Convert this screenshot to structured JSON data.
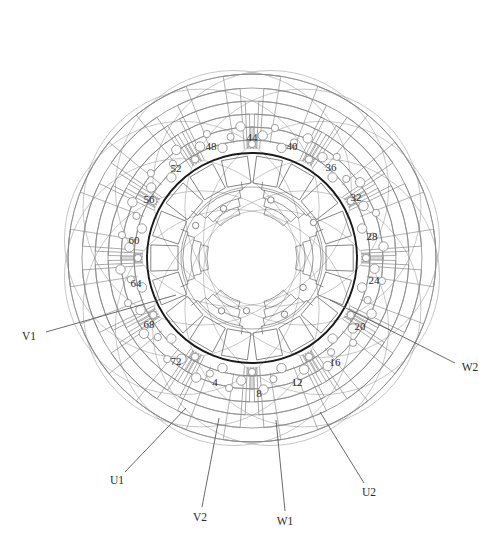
{
  "diagram": {
    "type": "winding-diagram",
    "slot_count": 72,
    "phases": 3,
    "background_color": "#ffffff",
    "bore_circle_color": "#1a1a1a",
    "winding_line_color": "#8a8a8a",
    "coil_line_color": "#6f6f6f",
    "label_color": "#2b2b2b",
    "center": {
      "x": 252,
      "y": 258
    },
    "bore_radius": 105
  },
  "slot_labels": [
    {
      "text": "4",
      "x": 215,
      "y": 382,
      "slot": 4
    },
    {
      "text": "8",
      "x": 259,
      "y": 393,
      "slot": 8
    },
    {
      "text": "12",
      "x": 297,
      "y": 382,
      "slot": 12
    },
    {
      "text": "16",
      "x": 335,
      "y": 362,
      "slot": 16
    },
    {
      "text": "20",
      "x": 360,
      "y": 326,
      "slot": 20
    },
    {
      "text": "24",
      "x": 374,
      "y": 280,
      "slot": 24
    },
    {
      "text": "28",
      "x": 372,
      "y": 236,
      "slot": 28
    },
    {
      "text": "32",
      "x": 356,
      "y": 197,
      "slot": 32
    },
    {
      "text": "36",
      "x": 331,
      "y": 167,
      "slot": 36
    },
    {
      "text": "40",
      "x": 292,
      "y": 146,
      "slot": 40
    },
    {
      "text": "44",
      "x": 252,
      "y": 137,
      "slot": 44
    },
    {
      "text": "48",
      "x": 211,
      "y": 146,
      "slot": 48
    },
    {
      "text": "52",
      "x": 176,
      "y": 168,
      "slot": 52
    },
    {
      "text": "56",
      "x": 149,
      "y": 199,
      "slot": 56
    },
    {
      "text": "60",
      "x": 134,
      "y": 240,
      "slot": 60
    },
    {
      "text": "64",
      "x": 136,
      "y": 283,
      "slot": 64
    },
    {
      "text": "68",
      "x": 149,
      "y": 324,
      "slot": 68
    },
    {
      "text": "72",
      "x": 176,
      "y": 361,
      "slot": 72
    }
  ],
  "terminals": [
    {
      "text": "V1",
      "x": 29,
      "y": 336,
      "lead_from": {
        "x": 46,
        "y": 332
      },
      "lead_to": {
        "x": 176,
        "y": 295
      }
    },
    {
      "text": "W2",
      "x": 470,
      "y": 367,
      "lead_from": {
        "x": 455,
        "y": 363
      },
      "lead_to": {
        "x": 330,
        "y": 300
      }
    },
    {
      "text": "U1",
      "x": 117,
      "y": 480,
      "lead_from": {
        "x": 125,
        "y": 472
      },
      "lead_to": {
        "x": 186,
        "y": 408
      }
    },
    {
      "text": "V2",
      "x": 200,
      "y": 517,
      "lead_from": {
        "x": 202,
        "y": 507
      },
      "lead_to": {
        "x": 219,
        "y": 418
      }
    },
    {
      "text": "W1",
      "x": 285,
      "y": 521,
      "lead_from": {
        "x": 285,
        "y": 511
      },
      "lead_to": {
        "x": 276,
        "y": 420
      }
    },
    {
      "text": "U2",
      "x": 369,
      "y": 492,
      "lead_from": {
        "x": 364,
        "y": 483
      },
      "lead_to": {
        "x": 320,
        "y": 412
      }
    }
  ],
  "legend": {
    "note": ""
  }
}
